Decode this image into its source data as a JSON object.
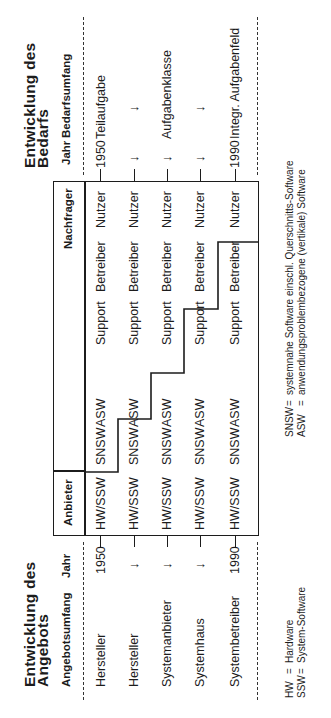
{
  "left": {
    "title_line1": "Entwicklung des",
    "title_line2": "Angebots",
    "headers": {
      "scope": "Angebotsumfang",
      "year": "Jahr"
    },
    "rows": [
      {
        "scope": "Hersteller",
        "year": "1950"
      },
      {
        "scope": "Hersteller",
        "year": "↓"
      },
      {
        "scope": "Systemanbieter",
        "year": "↓"
      },
      {
        "scope": "Systemhaus",
        "year": "↓"
      },
      {
        "scope": "Systembetreiber",
        "year": "1990"
      }
    ]
  },
  "right": {
    "title_line1": "Entwicklung des",
    "title_line2": "Bedarfs",
    "headers": {
      "year": "Jahr",
      "scope": "Bedarfsumfang"
    },
    "rows": [
      {
        "year": "1950",
        "scope": "Teilaufgabe"
      },
      {
        "year": "↓",
        "scope": "↓"
      },
      {
        "year": "↓",
        "scope": "Aufgabenklasse"
      },
      {
        "year": "↓",
        "scope": "↓"
      },
      {
        "year": "1990",
        "scope": "Integr. Aufgabenfeld"
      }
    ]
  },
  "box": {
    "header_provider": "Anbieter",
    "header_demander": "Nachfrager",
    "columns": [
      "HW/SSW",
      "SNSW",
      "ASW",
      "Support",
      "Betreiber",
      "Nutzer"
    ],
    "rows": [
      [
        "HW/SSW",
        "SNSW",
        "ASW",
        "Support",
        "Betreiber",
        "Nutzer"
      ],
      [
        "HW/SSW",
        "SNSW",
        "ASW",
        "Support",
        "Betreiber",
        "Nutzer"
      ],
      [
        "HW/SSW",
        "SNSW",
        "ASW",
        "Support",
        "Betreiber",
        "Nutzer"
      ],
      [
        "HW/SSW",
        "SNSW",
        "ASW",
        "Support",
        "Betreiber",
        "Nutzer"
      ],
      [
        "HW/SSW",
        "SNSW",
        "ASW",
        "Support",
        "Betreiber",
        "Nutzer"
      ]
    ]
  },
  "legend": {
    "left": [
      {
        "abbr": "HW",
        "eq": "=",
        "desc": "Hardware"
      },
      {
        "abbr": "SSW",
        "eq": "=",
        "desc": "System-Software"
      }
    ],
    "right": [
      {
        "abbr": "SNSW",
        "eq": "=",
        "desc": "systemnahe Software einschl. Querschnitts-Software"
      },
      {
        "abbr": "ASW",
        "eq": "=",
        "desc": "anwendungsproblembezogene (vertikale) Software"
      }
    ]
  },
  "colors": {
    "ink": "#1c1c1c",
    "paper": "#ffffff"
  }
}
